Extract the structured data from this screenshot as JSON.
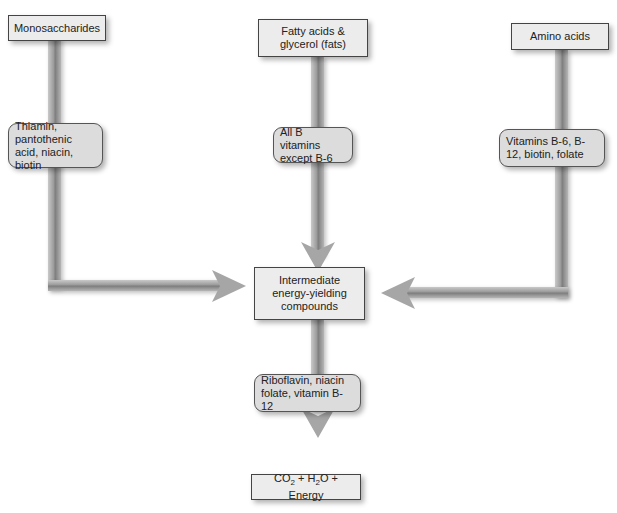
{
  "sources": [
    {
      "id": "monosaccharides",
      "label": "Monosaccharides"
    },
    {
      "id": "fats",
      "label": "Fatty acids & glycerol (fats)"
    },
    {
      "id": "amino-acids",
      "label": "Amino acids"
    }
  ],
  "vitamins": [
    {
      "id": "monosaccharides-vitamins",
      "label": "Thiamin, pantothenic acid, niacin, biotin"
    },
    {
      "id": "fats-vitamins",
      "label": "All B vitamins except B-6"
    },
    {
      "id": "amino-vitamins",
      "label": "Vitamins B-6, B-12, biotin, folate"
    }
  ],
  "intermediate": {
    "label": "Intermediate energy-yielding compounds"
  },
  "final_vitamins": {
    "label": "Riboflavin, niacin folate, vitamin B-12"
  },
  "products": {
    "co2": "CO",
    "sub2a": "2",
    "plus1": " + H",
    "sub2b": "2",
    "rest": "O + Energy"
  },
  "colors": {
    "pipe": "#999999",
    "box_fill": "#ececec",
    "rounded_fill": "#dcdcdc",
    "border": "#444444"
  }
}
